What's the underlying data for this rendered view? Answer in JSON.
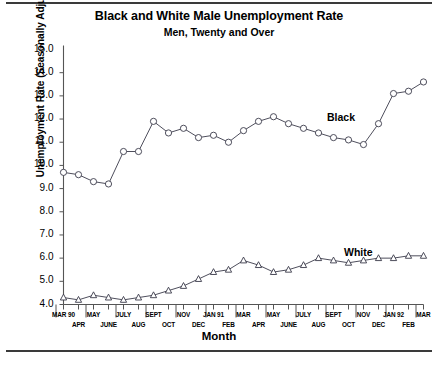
{
  "chart_data": {
    "type": "line",
    "title": "Black and White Male Unemployment Rate",
    "subtitle": "Men, Twenty and Over",
    "xlabel": "Month",
    "ylabel": "Unemployment Rate (Seasonally Adjusted)",
    "ylim": [
      4.0,
      15.0
    ],
    "ytick_step": 1.0,
    "grid": false,
    "legend_position": "inline-annotation",
    "ytick_labels": [
      "15.0",
      "14.0",
      "13.0",
      "12.0",
      "11.0",
      "10.0",
      "9.0",
      "8.0",
      "7.0",
      "6.0",
      "5.0",
      "4.0"
    ],
    "categories": [
      "MAR 90",
      "APR",
      "MAY",
      "JUNE",
      "JULY",
      "AUG",
      "SEPT",
      "OCT",
      "NOV",
      "DEC",
      "JAN 91",
      "FEB",
      "MAR",
      "APR",
      "MAY",
      "JUNE",
      "JULY",
      "AUG",
      "SEPT",
      "OCT",
      "NOV",
      "DEC",
      "JAN 92",
      "FEB",
      "MAR"
    ],
    "xtick_labels_top": [
      "MAR 90",
      "MAY",
      "JULY",
      "SEPT",
      "NOV",
      "JAN 91",
      "MAR",
      "MAY",
      "JULY",
      "SEPT",
      "NOV",
      "JAN 92",
      "MAR"
    ],
    "xtick_labels_bottom": [
      "APR",
      "JUNE",
      "AUG",
      "OCT",
      "DEC",
      "FEB",
      "APR",
      "JUNE",
      "AUG",
      "OCT",
      "DEC",
      "FEB"
    ],
    "series": [
      {
        "name": "Black",
        "marker": "circle",
        "color": "#3a3a4a",
        "values": [
          9.7,
          9.6,
          9.3,
          9.2,
          10.6,
          10.6,
          11.9,
          11.4,
          11.6,
          11.2,
          11.3,
          11.0,
          11.5,
          11.9,
          12.1,
          11.8,
          11.6,
          11.4,
          11.2,
          11.1,
          10.9,
          11.8,
          13.1,
          13.2,
          13.6
        ],
        "label_text": "Black"
      },
      {
        "name": "White",
        "marker": "triangle",
        "color": "#3a3a4a",
        "values": [
          4.3,
          4.2,
          4.4,
          4.3,
          4.2,
          4.3,
          4.4,
          4.6,
          4.8,
          5.1,
          5.4,
          5.5,
          5.9,
          5.7,
          5.4,
          5.5,
          5.7,
          6.0,
          5.9,
          5.8,
          5.9,
          6.0,
          6.0,
          6.1,
          6.1
        ],
        "label_text": "White"
      }
    ]
  }
}
